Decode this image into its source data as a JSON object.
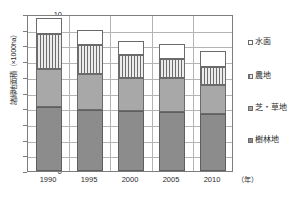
{
  "chart_data": {
    "type": "bar",
    "subtype": "stacked-bar",
    "title": "",
    "xlabel": "年",
    "xlabel_display": "（年）",
    "ylabel": "諸緑地面積（×1000ha）",
    "categories": [
      "1990",
      "1995",
      "2000",
      "2005",
      "2010"
    ],
    "ylim": [
      0,
      10
    ],
    "yticks": [
      "0",
      "1",
      "2",
      "3",
      "4",
      "5",
      "6",
      "7",
      "8",
      "9",
      "10"
    ],
    "grid": true,
    "legend_position": "right",
    "series": [
      {
        "name": "樹林地",
        "key": "woodland",
        "fill": "solid-dark-gray",
        "color": "#8c8c8c",
        "values": [
          4.05,
          3.9,
          3.8,
          3.75,
          3.6
        ]
      },
      {
        "name": "芝・草地",
        "key": "lawn",
        "fill": "solid-medium-gray",
        "color": "#a8a8a8",
        "values": [
          2.45,
          2.3,
          2.1,
          2.15,
          1.9
        ]
      },
      {
        "name": "農地",
        "key": "farmland",
        "fill": "vertical-stripes",
        "color": "#d8d8d8",
        "values": [
          2.25,
          1.8,
          1.5,
          1.25,
          1.15
        ]
      },
      {
        "name": "水面",
        "key": "water",
        "fill": "white",
        "color": "#ffffff",
        "values": [
          1.0,
          1.0,
          0.9,
          0.95,
          1.0
        ]
      }
    ],
    "totals": [
      9.75,
      9.0,
      8.3,
      8.1,
      7.65
    ],
    "cumulative_tops": [
      [
        4.05,
        6.5,
        8.75,
        9.75
      ],
      [
        3.9,
        6.2,
        8.0,
        9.0
      ],
      [
        3.8,
        5.9,
        7.4,
        8.3
      ],
      [
        3.75,
        5.9,
        7.15,
        8.1
      ],
      [
        3.6,
        5.5,
        6.65,
        7.65
      ]
    ]
  },
  "legend": {
    "items": [
      {
        "label": "水面"
      },
      {
        "label": "農地"
      },
      {
        "label": "芝・草地"
      },
      {
        "label": "樹林地"
      }
    ]
  },
  "axis": {
    "y_title": "諸緑地面積（×1000ha）",
    "x_unit": "（年）"
  }
}
